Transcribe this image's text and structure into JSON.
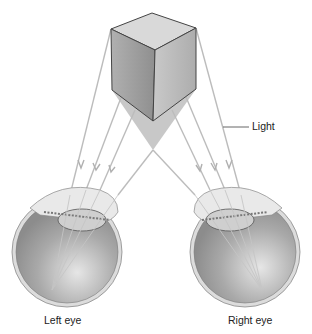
{
  "diagram": {
    "labels": {
      "light": "Light",
      "left_eye": "Left eye",
      "right_eye": "Right eye"
    },
    "colors": {
      "background": "#ffffff",
      "cube_top": "#d9d9d9",
      "cube_left": "#9a9a9a",
      "cube_right": "#bdbdbd",
      "cube_edge": "#444444",
      "shadow": "#c8c8c8",
      "ray": "#b9b9b9",
      "eyeball": "#a8a8a8",
      "sclera_rim": "#d8d8d8",
      "label_text": "#222222"
    }
  }
}
